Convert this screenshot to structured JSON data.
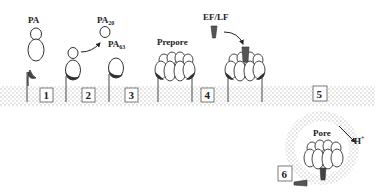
{
  "figure": {
    "labels": {
      "pa": "PA",
      "pa20_base": "PA",
      "pa20_sub": "20",
      "pa63_base": "PA",
      "pa63_sub": "63",
      "prepore": "Prepore",
      "ef_lf": "EF/LF",
      "proton_base": "H",
      "proton_sup": "+",
      "pore": "Pore"
    },
    "steps": [
      "1",
      "2",
      "3",
      "4",
      "5",
      "6"
    ],
    "colors": {
      "membrane_dots": "#b8b8b8",
      "outline": "#333333",
      "receptor_fill": "#444444",
      "ligand_fill": "#555555",
      "background": "#ffffff"
    }
  }
}
